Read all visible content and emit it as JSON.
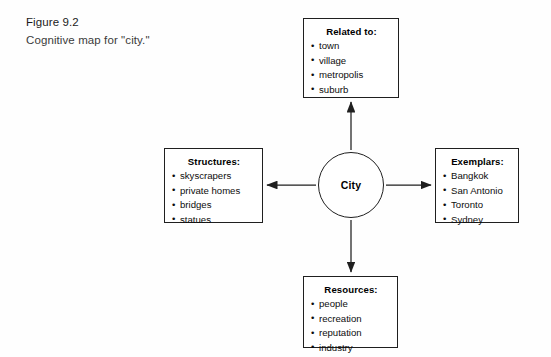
{
  "figure": {
    "number_label": "Figure 9.2",
    "caption": "Cognitive map for \"city.\""
  },
  "diagram": {
    "type": "cognitive-map",
    "center": {
      "label": "City",
      "shape": "circle"
    },
    "edges": [
      {
        "from": "City",
        "to": "Related to:",
        "direction": "up",
        "arrow": "single"
      },
      {
        "from": "City",
        "to": "Exemplars:",
        "direction": "right",
        "arrow": "single"
      },
      {
        "from": "City",
        "to": "Resources:",
        "direction": "down",
        "arrow": "single"
      },
      {
        "from": "City",
        "to": "Structures:",
        "direction": "left",
        "arrow": "single"
      }
    ],
    "nodes": {
      "related": {
        "heading": "Related to:",
        "items": [
          "town",
          "village",
          "metropolis",
          "suburb"
        ]
      },
      "structures": {
        "heading": "Structures:",
        "items": [
          "skyscrapers",
          "private homes",
          "bridges",
          "statues"
        ]
      },
      "exemplars": {
        "heading": "Exemplars:",
        "items": [
          "Bangkok",
          "San Antonio",
          "Toronto",
          "Sydney"
        ]
      },
      "resources": {
        "heading": "Resources:",
        "items": [
          "people",
          "recreation",
          "reputation",
          "industry"
        ]
      }
    }
  },
  "colors": {
    "stroke": "#1f1f1f",
    "text": "#0d0d0d",
    "background": "#fefefe"
  }
}
